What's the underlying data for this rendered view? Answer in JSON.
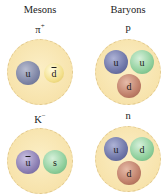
{
  "columns": {
    "mesons": "Mesons",
    "baryons": "Baryons"
  },
  "particles": {
    "pi_plus": {
      "name": "π",
      "charge": "+",
      "quarks": [
        {
          "label": "u",
          "antiquark": false,
          "color": "#7f86a6"
        },
        {
          "label": "d",
          "antiquark": true,
          "color": "#f3e08c"
        }
      ]
    },
    "proton": {
      "name": "p",
      "quarks": [
        {
          "label": "u",
          "antiquark": false,
          "color": "#6f76a8"
        },
        {
          "label": "u",
          "antiquark": false,
          "color": "#8fcf9c"
        },
        {
          "label": "d",
          "antiquark": false,
          "color": "#c0806a"
        }
      ]
    },
    "k_minus": {
      "name": "K",
      "charge": "−",
      "quarks": [
        {
          "label": "u",
          "antiquark": true,
          "color": "#8c7fb3"
        },
        {
          "label": "s",
          "antiquark": false,
          "color": "#8fcf9c"
        }
      ]
    },
    "neutron": {
      "name": "n",
      "quarks": [
        {
          "label": "u",
          "antiquark": false,
          "color": "#6f76a8"
        },
        {
          "label": "d",
          "antiquark": false,
          "color": "#8fcf9c"
        },
        {
          "label": "d",
          "antiquark": false,
          "color": "#c0806a"
        }
      ]
    }
  }
}
